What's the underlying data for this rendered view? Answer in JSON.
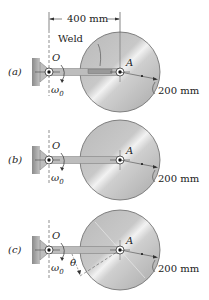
{
  "figure": {
    "dimension_top": "400 mm",
    "weld_label": "Weld",
    "panels": [
      {
        "id": "a",
        "label": "(a)",
        "pivot": "O",
        "center": "A",
        "omega": "ω",
        "omega_sub": "0",
        "radius": "200 mm",
        "has_weld": true,
        "has_theta": false
      },
      {
        "id": "b",
        "label": "(b)",
        "pivot": "O",
        "center": "A",
        "omega": "ω",
        "omega_sub": "0",
        "radius": "200 mm",
        "has_weld": false,
        "has_theta": false
      },
      {
        "id": "c",
        "label": "(c)",
        "pivot": "O",
        "center": "A",
        "omega": "ω",
        "omega_sub": "0",
        "radius": "200 mm",
        "has_weld": false,
        "has_theta": true,
        "theta": "θ"
      }
    ]
  }
}
